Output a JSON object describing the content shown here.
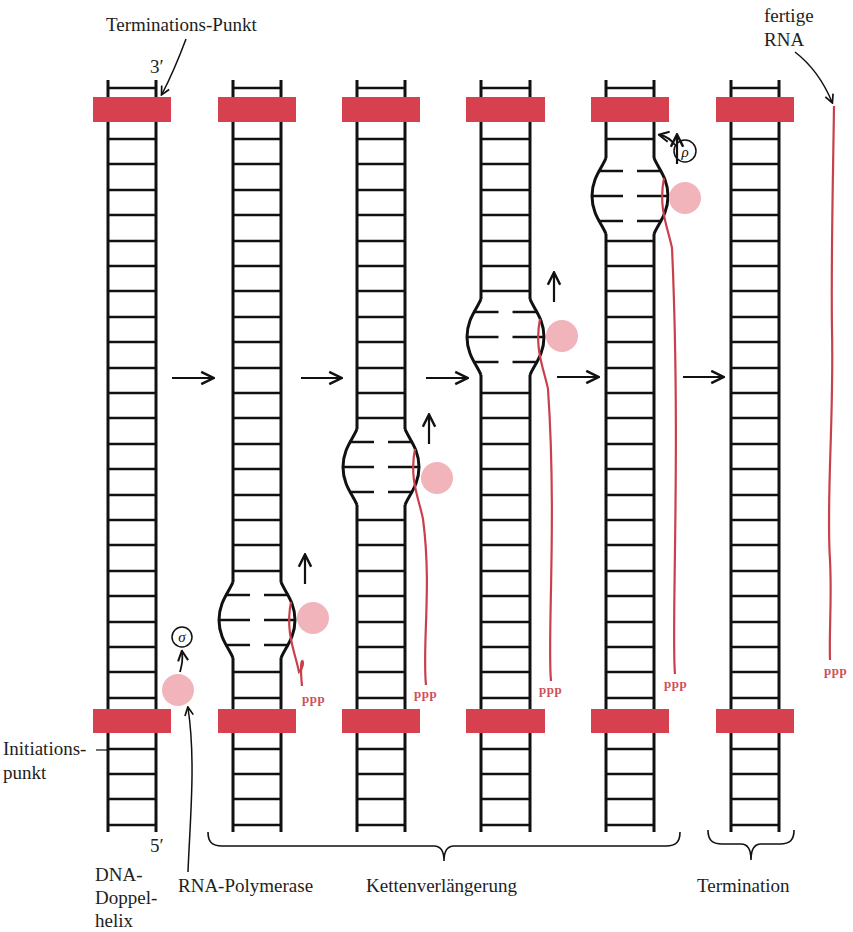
{
  "figure": {
    "labels": {
      "termination_point": "Terminations-Punkt",
      "three_prime": "3′",
      "five_prime": "5′",
      "initiation_point_line1": "Initiations-",
      "initiation_point_line2": "punkt",
      "dna_line1": "DNA-",
      "dna_line2": "Doppel-",
      "dna_line3": "helix",
      "rna_polymerase": "RNA-Polymerase",
      "elongation": "Kettenverlängerung",
      "termination": "Termination",
      "finished_rna_line1": "fertige",
      "finished_rna_line2": "RNA",
      "ppp": "ppp",
      "sigma": "σ",
      "rho": "ρ"
    },
    "colors": {
      "marker_red": "#d6404f",
      "rna_red": "#c9404c",
      "polymerase_pink": "#f2b4bb",
      "ink": "#111111"
    },
    "stages": [
      {
        "name": "initiation-start",
        "left": 108,
        "right": 156,
        "bubble": null,
        "polymerase": [
          178,
          690
        ],
        "rna_end": null
      },
      {
        "name": "initiation",
        "left": 233,
        "right": 281,
        "bubble": 620,
        "polymerase": [
          313,
          618
        ],
        "rna_end": 686
      },
      {
        "name": "elongation-1",
        "left": 357,
        "right": 405,
        "bubble": 467,
        "polymerase": [
          437,
          478
        ],
        "rna_end": 685
      },
      {
        "name": "elongation-2",
        "left": 481,
        "right": 530,
        "bubble": 337,
        "polymerase": [
          562,
          336
        ],
        "rna_end": 681
      },
      {
        "name": "elongation-3",
        "left": 606,
        "right": 654,
        "bubble": 196,
        "polymerase": [
          685,
          198
        ],
        "rna_end": 674
      },
      {
        "name": "termination",
        "left": 731,
        "right": 779,
        "bubble": null,
        "polymerase": null,
        "rna_end": null
      }
    ],
    "step_arrows": [
      {
        "x1": 172,
        "x2": 212,
        "y": 378
      },
      {
        "x1": 301,
        "x2": 340,
        "y": 378
      },
      {
        "x1": 426,
        "x2": 466,
        "y": 378
      },
      {
        "x1": 557,
        "x2": 597,
        "y": 377
      },
      {
        "x1": 683,
        "x2": 722,
        "y": 377
      }
    ],
    "ladder": {
      "top": 80,
      "bottom": 832,
      "rung_start": 139,
      "rung_step": 25.4,
      "top_marker_y": 97,
      "bottom_marker_y": 709,
      "marker_h": 25
    }
  }
}
